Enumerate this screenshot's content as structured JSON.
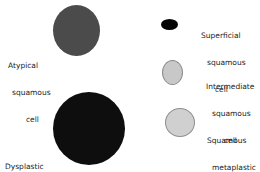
{
  "diagram": {
    "cells": [
      {
        "id": "atypical",
        "label_lines": [
          "Atypical",
          "squamous",
          "cell"
        ],
        "fill": "#4a4a4a"
      },
      {
        "id": "dysplastic",
        "label_lines": [
          "Dysplastic",
          "squamous  cell"
        ],
        "fill": "#0e0e0e"
      },
      {
        "id": "superficial",
        "label_lines": [
          "Superficial",
          "squamous",
          "cell"
        ],
        "fill": "#050505"
      },
      {
        "id": "intermediate",
        "label_lines": [
          "Intermediate",
          "squamous",
          "cell"
        ],
        "fill": "#c8c8c8"
      },
      {
        "id": "metaplastic",
        "label_lines": [
          "Squamous",
          "metaplastic",
          "cell"
        ],
        "fill": "#cfcfcf"
      }
    ]
  }
}
